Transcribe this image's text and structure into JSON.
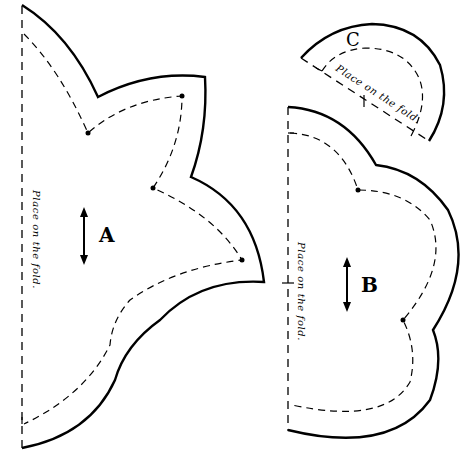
{
  "diagram": {
    "type": "sewing-pattern",
    "pieces": [
      {
        "id": "A",
        "label": "A",
        "fold_text": "Place on the fold.",
        "grainline": "vertical double arrow"
      },
      {
        "id": "B",
        "label": "B",
        "fold_text": "Place on the fold.",
        "grainline": "vertical double arrow"
      },
      {
        "id": "C",
        "label": "C",
        "fold_text": "Place on the fold."
      }
    ],
    "colors": {
      "line": "#000000",
      "background": "#ffffff"
    }
  }
}
